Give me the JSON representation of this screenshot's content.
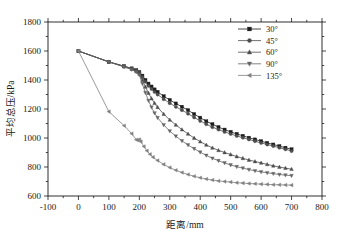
{
  "chart_data": {
    "type": "line",
    "title": "",
    "xlabel": "距离/mm",
    "ylabel": "平均总压/kPa",
    "xlim": [
      -100,
      800
    ],
    "ylim": [
      600,
      1800
    ],
    "xticks": [
      -100,
      0,
      100,
      200,
      300,
      400,
      500,
      600,
      700,
      800
    ],
    "xtick_labels": [
      "-100",
      "0",
      "100",
      "200",
      "300",
      "400",
      "500",
      "600",
      "700",
      "800"
    ],
    "yticks": [
      600,
      800,
      1000,
      1200,
      1400,
      1600,
      1800
    ],
    "ytick_labels": [
      "600",
      "800",
      "1000",
      "1200",
      "1400",
      "1600",
      "1800"
    ],
    "x_minor_tick_step": 50,
    "y_minor_tick_step": 100,
    "grid": false,
    "legend_position": "top-right",
    "legend_border": false,
    "series": [
      {
        "name": "30°",
        "marker": "square",
        "color": "#1a1a1a",
        "points": [
          [
            0,
            1600
          ],
          [
            100,
            1525
          ],
          [
            150,
            1495
          ],
          [
            175,
            1480
          ],
          [
            190,
            1468
          ],
          [
            200,
            1455
          ],
          [
            210,
            1430
          ],
          [
            220,
            1400
          ],
          [
            230,
            1375
          ],
          [
            240,
            1355
          ],
          [
            250,
            1335
          ],
          [
            260,
            1318
          ],
          [
            280,
            1288
          ],
          [
            300,
            1262
          ],
          [
            320,
            1238
          ],
          [
            340,
            1215
          ],
          [
            360,
            1192
          ],
          [
            380,
            1165
          ],
          [
            400,
            1140
          ],
          [
            420,
            1115
          ],
          [
            440,
            1095
          ],
          [
            460,
            1075
          ],
          [
            480,
            1058
          ],
          [
            500,
            1042
          ],
          [
            520,
            1028
          ],
          [
            540,
            1015
          ],
          [
            560,
            1002
          ],
          [
            580,
            990
          ],
          [
            600,
            978
          ],
          [
            620,
            966
          ],
          [
            640,
            955
          ],
          [
            660,
            944
          ],
          [
            680,
            933
          ],
          [
            700,
            922
          ]
        ]
      },
      {
        "name": "45°",
        "marker": "circle",
        "color": "#4d4d4d",
        "points": [
          [
            0,
            1600
          ],
          [
            100,
            1525
          ],
          [
            150,
            1495
          ],
          [
            175,
            1478
          ],
          [
            190,
            1465
          ],
          [
            200,
            1450
          ],
          [
            210,
            1420
          ],
          [
            220,
            1388
          ],
          [
            230,
            1360
          ],
          [
            240,
            1338
          ],
          [
            250,
            1318
          ],
          [
            260,
            1300
          ],
          [
            280,
            1268
          ],
          [
            300,
            1240
          ],
          [
            320,
            1215
          ],
          [
            340,
            1192
          ],
          [
            360,
            1168
          ],
          [
            380,
            1142
          ],
          [
            400,
            1118
          ],
          [
            420,
            1095
          ],
          [
            440,
            1075
          ],
          [
            460,
            1058
          ],
          [
            480,
            1042
          ],
          [
            500,
            1028
          ],
          [
            520,
            1014
          ],
          [
            540,
            1002
          ],
          [
            560,
            990
          ],
          [
            580,
            978
          ],
          [
            600,
            966
          ],
          [
            620,
            955
          ],
          [
            640,
            944
          ],
          [
            660,
            933
          ],
          [
            680,
            922
          ],
          [
            700,
            910
          ]
        ]
      },
      {
        "name": "60°",
        "marker": "triangle-up",
        "color": "#4d4d4d",
        "points": [
          [
            0,
            1600
          ],
          [
            100,
            1525
          ],
          [
            150,
            1492
          ],
          [
            175,
            1475
          ],
          [
            190,
            1460
          ],
          [
            200,
            1442
          ],
          [
            210,
            1400
          ],
          [
            220,
            1352
          ],
          [
            230,
            1310
          ],
          [
            240,
            1272
          ],
          [
            250,
            1240
          ],
          [
            260,
            1212
          ],
          [
            280,
            1165
          ],
          [
            300,
            1125
          ],
          [
            320,
            1090
          ],
          [
            340,
            1058
          ],
          [
            360,
            1028
          ],
          [
            380,
            1000
          ],
          [
            400,
            975
          ],
          [
            420,
            952
          ],
          [
            440,
            932
          ],
          [
            460,
            915
          ],
          [
            480,
            900
          ],
          [
            500,
            886
          ],
          [
            520,
            872
          ],
          [
            540,
            860
          ],
          [
            560,
            848
          ],
          [
            580,
            838
          ],
          [
            600,
            828
          ],
          [
            620,
            818
          ],
          [
            640,
            808
          ],
          [
            660,
            800
          ],
          [
            680,
            792
          ],
          [
            700,
            785
          ]
        ]
      },
      {
        "name": "90°",
        "marker": "triangle-down",
        "color": "#666666",
        "points": [
          [
            0,
            1600
          ],
          [
            100,
            1525
          ],
          [
            150,
            1490
          ],
          [
            175,
            1472
          ],
          [
            190,
            1455
          ],
          [
            200,
            1435
          ],
          [
            210,
            1375
          ],
          [
            220,
            1312
          ],
          [
            230,
            1258
          ],
          [
            240,
            1212
          ],
          [
            250,
            1172
          ],
          [
            260,
            1140
          ],
          [
            280,
            1090
          ],
          [
            300,
            1048
          ],
          [
            320,
            1012
          ],
          [
            340,
            980
          ],
          [
            360,
            952
          ],
          [
            380,
            926
          ],
          [
            400,
            902
          ],
          [
            420,
            880
          ],
          [
            440,
            860
          ],
          [
            460,
            843
          ],
          [
            480,
            828
          ],
          [
            500,
            814
          ],
          [
            520,
            802
          ],
          [
            540,
            792
          ],
          [
            560,
            782
          ],
          [
            580,
            774
          ],
          [
            600,
            766
          ],
          [
            620,
            760
          ],
          [
            640,
            754
          ],
          [
            660,
            748
          ],
          [
            680,
            744
          ],
          [
            700,
            740
          ]
        ]
      },
      {
        "name": "135°",
        "marker": "triangle-left",
        "color": "#808080",
        "points": [
          [
            0,
            1600
          ],
          [
            100,
            1182
          ],
          [
            150,
            1085
          ],
          [
            175,
            1030
          ],
          [
            190,
            988
          ],
          [
            195,
            985
          ],
          [
            200,
            990
          ],
          [
            205,
            975
          ],
          [
            215,
            942
          ],
          [
            225,
            912
          ],
          [
            235,
            888
          ],
          [
            245,
            868
          ],
          [
            260,
            845
          ],
          [
            280,
            818
          ],
          [
            300,
            796
          ],
          [
            320,
            778
          ],
          [
            340,
            762
          ],
          [
            360,
            748
          ],
          [
            380,
            736
          ],
          [
            400,
            726
          ],
          [
            420,
            717
          ],
          [
            440,
            710
          ],
          [
            460,
            704
          ],
          [
            480,
            700
          ],
          [
            500,
            696
          ],
          [
            520,
            692
          ],
          [
            540,
            689
          ],
          [
            560,
            686
          ],
          [
            580,
            684
          ],
          [
            600,
            682
          ],
          [
            620,
            680
          ],
          [
            640,
            678
          ],
          [
            660,
            677
          ],
          [
            680,
            676
          ],
          [
            700,
            675
          ]
        ]
      }
    ]
  },
  "legend": {
    "entries": [
      {
        "label": "30°"
      },
      {
        "label": "45°"
      },
      {
        "label": "60°"
      },
      {
        "label": "90°"
      },
      {
        "label": "135°"
      }
    ]
  }
}
